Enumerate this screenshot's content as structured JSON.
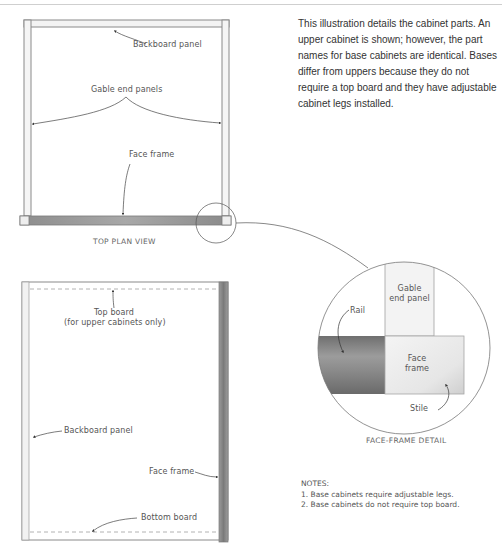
{
  "description": "This illustration details the cabinet parts. An upper cabinet is shown; however, the part names for base cabinets are identical. Bases differ from uppers because they do not require a top board and they have adjustable cabinet legs installed.",
  "top_plan_view": {
    "caption": "TOP PLAN VIEW",
    "labels": {
      "backboard": "Backboard panel",
      "gable": "Gable end panels",
      "face_frame": "Face frame"
    }
  },
  "front_view": {
    "labels": {
      "top_board_line1": "Top board",
      "top_board_line2": "(for upper cabinets only)",
      "backboard": "Backboard panel",
      "face_frame": "Face frame",
      "bottom_board": "Bottom board"
    }
  },
  "face_frame_detail": {
    "caption": "FACE-FRAME DETAIL",
    "labels": {
      "gable_line1": "Gable",
      "gable_line2": "end panel",
      "rail": "Rail",
      "face_line1": "Face",
      "face_line2": "frame",
      "stile": "Stile"
    }
  },
  "notes": {
    "heading": "NOTES:",
    "items": [
      "1. Base cabinets require adjustable legs.",
      "2. Base cabinets do not require top board."
    ]
  },
  "colors": {
    "line": "#8a8a8a",
    "rail_dark": "#7d7d7d",
    "panel_light": "#f0f0f0"
  }
}
